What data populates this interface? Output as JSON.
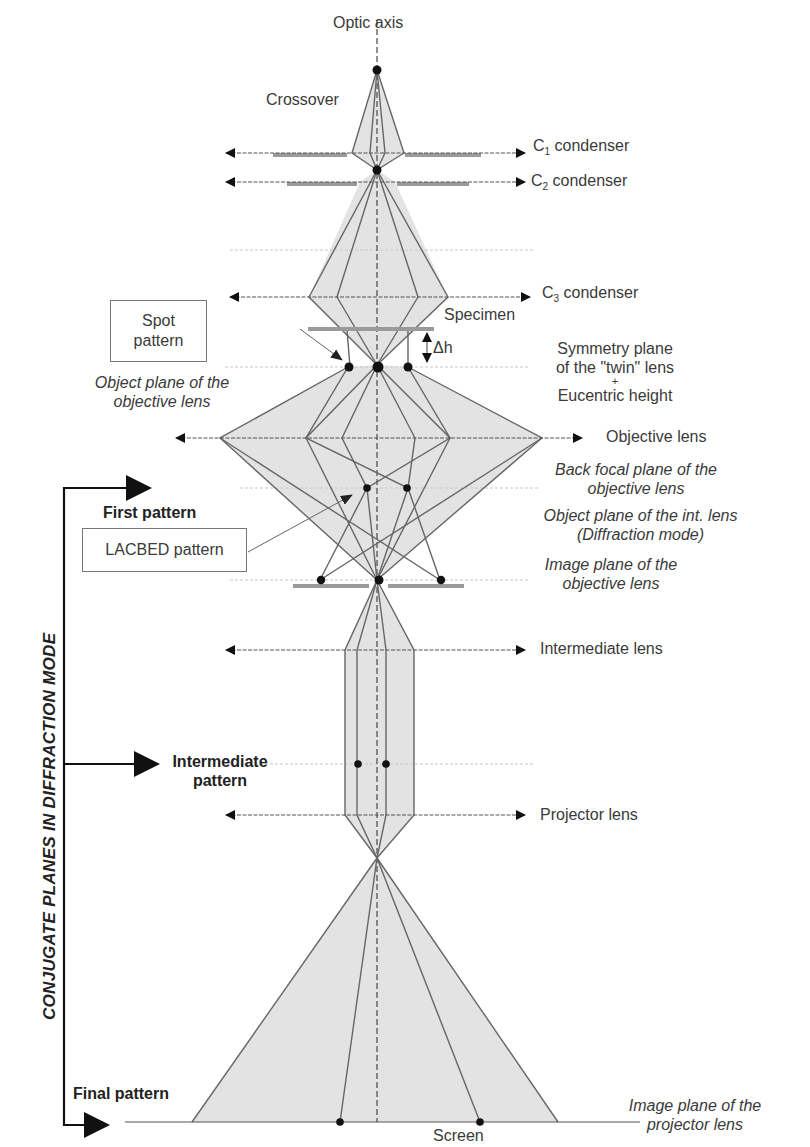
{
  "axis": {
    "label": "Optic axis"
  },
  "points": {
    "crossover": "Crossover",
    "specimen": "Specimen",
    "delta_h": "Δh",
    "screen": "Screen"
  },
  "lenses": [
    {
      "name": "C",
      "sub": "1",
      "suffix": " condenser"
    },
    {
      "name": "C",
      "sub": "2",
      "suffix": " condenser"
    },
    {
      "name": "C",
      "sub": "3",
      "suffix": " condenser"
    },
    {
      "name": "Objective lens"
    },
    {
      "name": "Intermediate lens"
    },
    {
      "name": "Projector lens"
    }
  ],
  "planes": {
    "symmetry_line1": "Symmetry plane",
    "symmetry_line2": "of the \"twin\" lens",
    "symmetry_plus": "+",
    "symmetry_line3": "Eucentric height",
    "object_plane_line1": "Object plane of the",
    "object_plane_line2": "objective lens",
    "bfp_line1": "Back focal plane of the",
    "bfp_line2": "objective lens",
    "int_object_line1": "Object plane of the int. lens",
    "int_object_line2": "(Diffraction mode)",
    "image_plane_obj_line1": "Image plane of the",
    "image_plane_obj_line2": "objective lens",
    "image_plane_proj_line1": "Image plane of the",
    "image_plane_proj_line2": "projector lens"
  },
  "callouts": {
    "spot_line1": "Spot",
    "spot_line2": "pattern",
    "lacbed": "LACBED pattern"
  },
  "patterns": {
    "first": "First pattern",
    "intermediate_line1": "Intermediate",
    "intermediate_line2": "pattern",
    "final": "Final pattern"
  },
  "side_label": "CONJUGATE PLANES IN DIFFRACTION MODE",
  "colors": {
    "beam_fill": "#e2e2e2",
    "ray": "#666666",
    "aperture": "#9a9a9a",
    "dot": "#111111",
    "arrow": "#111111"
  }
}
